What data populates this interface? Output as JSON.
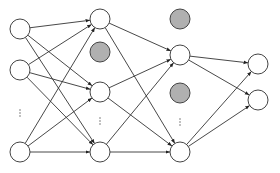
{
  "colors": {
    "edge": "#333333",
    "node_stroke": "#444444",
    "node_fill": "#ffffff",
    "dropped_fill": "#b0b0b0",
    "ellipsis": "#555555"
  },
  "node_radius": 10,
  "layers": [
    {
      "name": "input",
      "nodes": [
        {
          "id": "i0",
          "x": 20,
          "y": 29,
          "dropped": false
        },
        {
          "id": "i1",
          "x": 20,
          "y": 70,
          "dropped": false
        },
        {
          "id": "i2",
          "x": 20,
          "y": 152,
          "dropped": false
        }
      ],
      "ellipsis": {
        "x": 20,
        "y": 113,
        "text": "⋮"
      }
    },
    {
      "name": "hidden1",
      "nodes": [
        {
          "id": "h0",
          "x": 100,
          "y": 19,
          "dropped": false
        },
        {
          "id": "h1",
          "x": 100,
          "y": 52,
          "dropped": true
        },
        {
          "id": "h2",
          "x": 100,
          "y": 92,
          "dropped": false
        },
        {
          "id": "h3",
          "x": 100,
          "y": 152,
          "dropped": false
        }
      ],
      "ellipsis": {
        "x": 100,
        "y": 121,
        "text": "⋮"
      }
    },
    {
      "name": "hidden2",
      "nodes": [
        {
          "id": "g0",
          "x": 180,
          "y": 19,
          "dropped": true
        },
        {
          "id": "g1",
          "x": 180,
          "y": 55,
          "dropped": false
        },
        {
          "id": "g2",
          "x": 180,
          "y": 93,
          "dropped": true
        },
        {
          "id": "g3",
          "x": 180,
          "y": 152,
          "dropped": false
        }
      ],
      "ellipsis": {
        "x": 180,
        "y": 122,
        "text": "⋮"
      }
    },
    {
      "name": "output",
      "nodes": [
        {
          "id": "o0",
          "x": 258,
          "y": 64,
          "dropped": false
        },
        {
          "id": "o1",
          "x": 258,
          "y": 100,
          "dropped": false
        }
      ]
    }
  ],
  "edges": [
    [
      "i0",
      "h0"
    ],
    [
      "i0",
      "h2"
    ],
    [
      "i0",
      "h3"
    ],
    [
      "i1",
      "h0"
    ],
    [
      "i1",
      "h2"
    ],
    [
      "i1",
      "h3"
    ],
    [
      "i2",
      "h0"
    ],
    [
      "i2",
      "h2"
    ],
    [
      "i2",
      "h3"
    ],
    [
      "h0",
      "g1"
    ],
    [
      "h0",
      "g3"
    ],
    [
      "h2",
      "g1"
    ],
    [
      "h2",
      "g3"
    ],
    [
      "h3",
      "g1"
    ],
    [
      "h3",
      "g3"
    ],
    [
      "g1",
      "o0"
    ],
    [
      "g1",
      "o1"
    ],
    [
      "g3",
      "o0"
    ],
    [
      "g3",
      "o1"
    ]
  ]
}
